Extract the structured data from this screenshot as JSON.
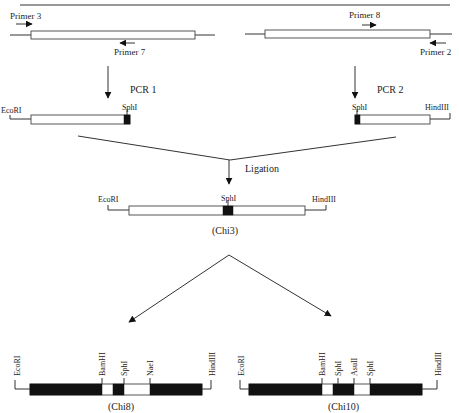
{
  "diagram": {
    "title": "",
    "template": {
      "left_primers": {
        "forward": "Primer 3",
        "reverse": "Primer 7"
      },
      "right_primers": {
        "forward": "Primer 8",
        "reverse": "Primer 2"
      }
    },
    "steps": {
      "pcr1": "PCR 1",
      "pcr2": "PCR 2",
      "ligation": "Ligation"
    },
    "fragment1": {
      "left_site": "EcoRI",
      "right_site": "SphI"
    },
    "fragment2": {
      "left_site": "SphI",
      "right_site": "HindIII"
    },
    "chi3": {
      "name": "(Chi3)",
      "left_site": "EcoRI",
      "middle_site": "SphI",
      "right_site": "HindIII"
    },
    "chi8": {
      "name": "(Chi8)",
      "sites": [
        "EcoRI",
        "BamHI",
        "SphI",
        "NaeI",
        "HindIII"
      ]
    },
    "chi10": {
      "name": "(Chi10)",
      "sites": [
        "EcoRI",
        "BamHI",
        "SphI",
        "AsuII",
        "SphI",
        "HindIII"
      ]
    },
    "colors": {
      "line": "#333333",
      "filled_segment": "#111111",
      "open_segment": "#ffffff"
    }
  }
}
